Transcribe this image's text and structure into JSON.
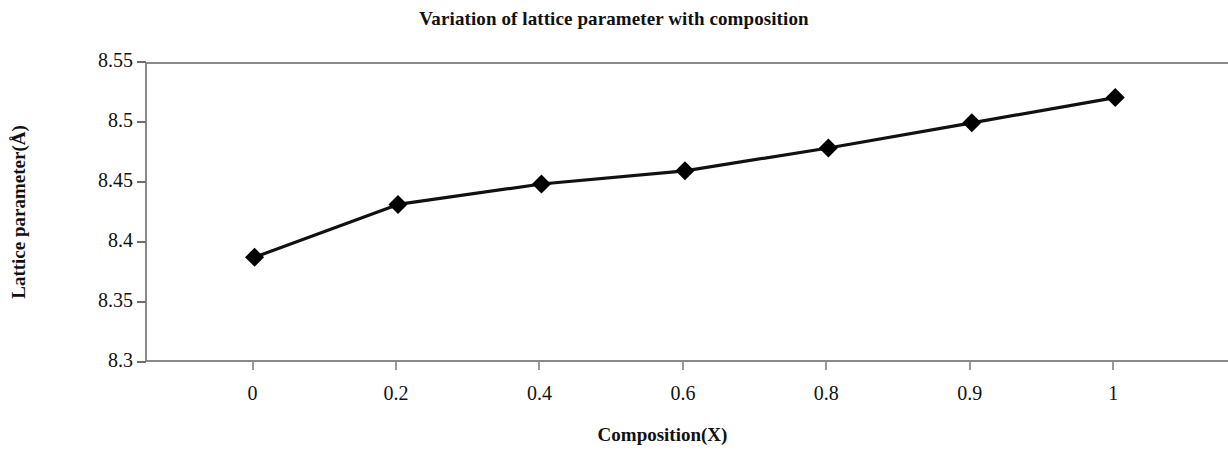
{
  "chart_data": {
    "type": "line",
    "title": "Variation of lattice parameter with composition",
    "xlabel": "Composition(X)",
    "ylabel": "Lattice parameter(Å)",
    "categories": [
      "0",
      "0.2",
      "0.4",
      "0.6",
      "0.8",
      "0.9",
      "1"
    ],
    "values": [
      8.389,
      8.433,
      8.45,
      8.461,
      8.48,
      8.501,
      8.522
    ],
    "series": [
      {
        "name": "Lattice parameter",
        "values": [
          8.389,
          8.433,
          8.45,
          8.461,
          8.48,
          8.501,
          8.522
        ]
      }
    ],
    "ylim": [
      8.3,
      8.55
    ],
    "ytick_labels": [
      "8.55",
      "8.5",
      "8.45",
      "8.4",
      "8.35",
      "8.3"
    ],
    "ytick_values": [
      8.55,
      8.5,
      8.45,
      8.4,
      8.35,
      8.3
    ],
    "grid": false,
    "legend": false,
    "marker": "diamond",
    "line_color": "#000000",
    "marker_color": "#000000",
    "axis_color": "#8a8a8a",
    "background_color": "#ffffff"
  }
}
